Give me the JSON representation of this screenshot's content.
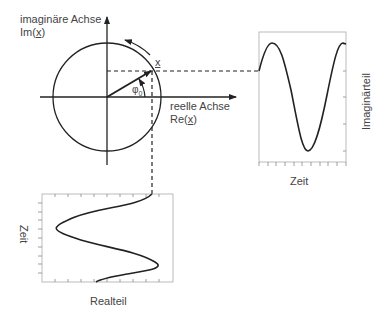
{
  "complex_plane": {
    "imag_axis_label_line1": "imaginäre Achse",
    "imag_axis_label_line2_prefix": "Im(",
    "imag_axis_label_line2_var": "x",
    "imag_axis_label_line2_suffix": ")",
    "real_axis_label_line1": "reelle Achse",
    "real_axis_label_line2_prefix": "Re(",
    "real_axis_label_line2_var": "x",
    "real_axis_label_line2_suffix": ")",
    "phasor_label": "x",
    "angle_label": "φ",
    "angle_subscript": "0"
  },
  "imag_plot": {
    "y_label": "Imaginärteil",
    "x_label": "Zeit"
  },
  "real_plot": {
    "y_label": "Zeit",
    "x_label": "Realteil"
  },
  "colors": {
    "line": "#222222",
    "frame": "#999999",
    "text": "#444444"
  }
}
